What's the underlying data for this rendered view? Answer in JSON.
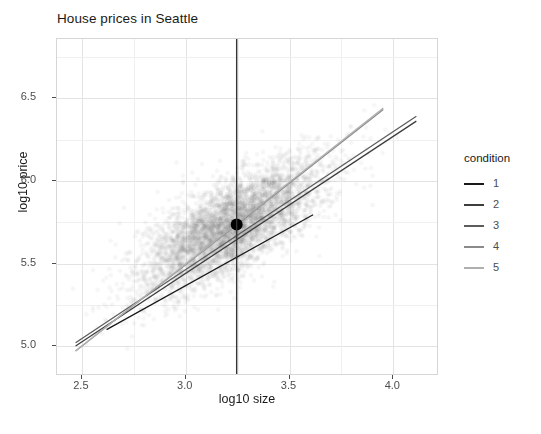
{
  "chart_data": {
    "type": "scatter",
    "title": "House prices in Seattle",
    "xlabel": "log10 size",
    "ylabel": "log10 price",
    "xlim": [
      2.38,
      4.22
    ],
    "ylim": [
      4.82,
      6.86
    ],
    "xticks": [
      "2.5",
      "3.0",
      "3.5",
      "4.0"
    ],
    "xtick_values": [
      2.5,
      3.0,
      3.5,
      4.0
    ],
    "yticks": [
      "5.0",
      "5.5",
      "6.0",
      "6.5"
    ],
    "ytick_values": [
      5.0,
      5.5,
      6.0,
      6.5
    ],
    "grid": true,
    "legend_position": "right",
    "legend_title": "condition",
    "series": [
      {
        "name": "1",
        "color": "#1a1a1a",
        "type": "line",
        "x": [
          2.62,
          3.62
        ],
        "y": [
          5.09,
          5.79
        ]
      },
      {
        "name": "2",
        "color": "#3d3d3d",
        "type": "line",
        "x": [
          2.47,
          4.12
        ],
        "y": [
          4.99,
          6.36
        ]
      },
      {
        "name": "3",
        "color": "#5c5c5c",
        "type": "line",
        "x": [
          2.47,
          4.12
        ],
        "y": [
          5.01,
          6.39
        ]
      },
      {
        "name": "4",
        "color": "#8a8a8a",
        "type": "line",
        "x": [
          2.47,
          3.96
        ],
        "y": [
          4.96,
          6.43
        ]
      },
      {
        "name": "5",
        "color": "#b0b0b0",
        "type": "line",
        "x": [
          2.47,
          3.96
        ],
        "y": [
          4.96,
          6.44
        ]
      }
    ],
    "annotations": [
      {
        "name": "prediction-point",
        "type": "point",
        "x": 3.25,
        "y": 5.73,
        "color": "#000000",
        "size": 6
      },
      {
        "name": "prediction-vline",
        "type": "vline",
        "x": 3.25,
        "color": "#333333"
      }
    ],
    "scatter": {
      "name": "house-observations",
      "color": "#808080",
      "alpha": 0.06,
      "center_x": 3.22,
      "center_y": 5.72,
      "x_spread": 0.22,
      "y_spread": 0.2,
      "correlation": 0.72,
      "n_points": 4600
    }
  },
  "legend": {
    "title": "condition",
    "items": [
      {
        "label": "1",
        "color": "#1a1a1a"
      },
      {
        "label": "2",
        "color": "#3d3d3d"
      },
      {
        "label": "3",
        "color": "#5c5c5c"
      },
      {
        "label": "4",
        "color": "#8a8a8a"
      },
      {
        "label": "5",
        "color": "#b0b0b0"
      }
    ]
  },
  "caption": {
    "text": ""
  }
}
